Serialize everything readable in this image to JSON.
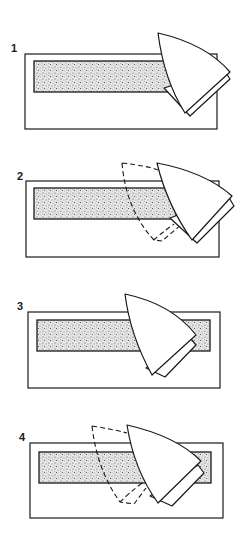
{
  "figure": {
    "panels": [
      {
        "label": "1",
        "description": "Iron placed at right end of strip"
      },
      {
        "label": "2",
        "description": "Iron moved along strip; previous position dashed"
      },
      {
        "label": "3",
        "description": "Iron positioned over strip"
      },
      {
        "label": "4",
        "description": "Iron moved again; previous position dashed"
      }
    ],
    "colors": {
      "line": "#1a1a1a",
      "background": "#ffffff",
      "stipple": "#8a8a8a"
    }
  }
}
